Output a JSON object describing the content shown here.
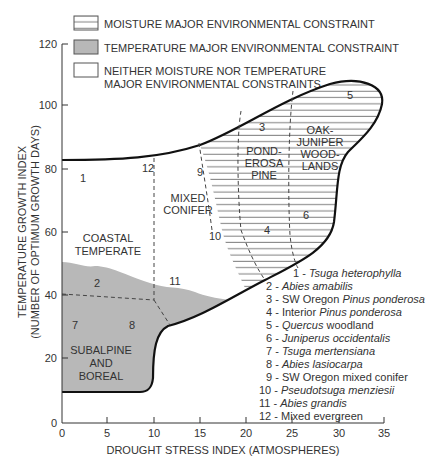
{
  "legend": {
    "moisture": "MOISTURE MAJOR ENVIRONMENTAL CONSTRAINT",
    "temperature": "TEMPERATURE MAJOR ENVIRONMENTAL CONSTRAINT",
    "neither_line1": "NEITHER MOISTURE NOR TEMPERATURE",
    "neither_line2": "MAJOR ENVIRONMENTAL CONSTRAINTS"
  },
  "axes": {
    "y_label_line1": "TEMPERATURE GROWTH INDEX",
    "y_label_line2": "(NUMBER OF OPTIMUM GROWTH DAYS)",
    "x_label": "DROUGHT STRESS INDEX (ATMOSPHERES)",
    "y_ticks": [
      "0",
      "20",
      "40",
      "60",
      "80",
      "100",
      "120"
    ],
    "x_ticks": [
      "0",
      "5",
      "10",
      "15",
      "20",
      "25",
      "30",
      "35"
    ]
  },
  "regions": {
    "coastal_line1": "COASTAL",
    "coastal_line2": "TEMPERATE",
    "mixed_line1": "MIXED",
    "mixed_line2": "CONIFER",
    "pond_line1": "POND-",
    "pond_line2": "EROSA",
    "pond_line3": "PINE",
    "oak_line1": "OAK-",
    "oak_line2": "JUNIPER",
    "oak_line3": "WOOD-",
    "oak_line4": "LANDS",
    "sub_line1": "SUBALPINE",
    "sub_line2": "AND",
    "sub_line3": "BOREAL"
  },
  "markers": [
    "1",
    "2",
    "3",
    "4",
    "5",
    "6",
    "7",
    "8",
    "9",
    "10",
    "11",
    "12"
  ],
  "species_key": [
    {
      "num": "1 - ",
      "name": "Tsuga heterophylla",
      "suffix": ""
    },
    {
      "num": "2 - ",
      "name": "Abies amabilis",
      "suffix": ""
    },
    {
      "num": "3 - SW Oregon ",
      "name": "Pinus ponderosa",
      "suffix": ""
    },
    {
      "num": "4 - Interior ",
      "name": "Pinus ponderosa",
      "suffix": ""
    },
    {
      "num": "5 - ",
      "name": "Quercus",
      "suffix": " woodland"
    },
    {
      "num": "6 - ",
      "name": "Juniperus occidentalis",
      "suffix": ""
    },
    {
      "num": "7 - ",
      "name": "Tsuga mertensiana",
      "suffix": ""
    },
    {
      "num": "8 - ",
      "name": "Abies lasiocarpa",
      "suffix": ""
    },
    {
      "num": "9 - SW Oregon mixed conifer",
      "name": "",
      "suffix": ""
    },
    {
      "num": "10 - ",
      "name": "Pseudotsuga menziesii",
      "suffix": ""
    },
    {
      "num": "11 - ",
      "name": "Abies grandis",
      "suffix": ""
    },
    {
      "num": "12 - Mixed evergreen",
      "name": "",
      "suffix": ""
    }
  ],
  "colors": {
    "temperature_fill": "#b8b8b8",
    "outline": "#111111",
    "hatch": "#555555"
  }
}
